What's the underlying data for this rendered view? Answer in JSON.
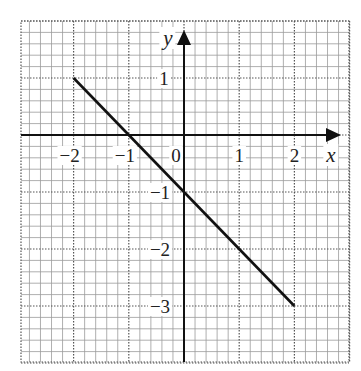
{
  "chart_data": {
    "type": "line",
    "title": "",
    "xlabel": "x",
    "ylabel": "y",
    "xlim": [
      -3,
      3
    ],
    "ylim": [
      -4,
      2
    ],
    "grid": true,
    "minor_divisions_per_unit": 5,
    "x_ticks": [
      {
        "value": -2,
        "label": "−2"
      },
      {
        "value": -1,
        "label": "−1"
      },
      {
        "value": 1,
        "label": "1"
      },
      {
        "value": 2,
        "label": "2"
      }
    ],
    "y_ticks": [
      {
        "value": 1,
        "label": "1"
      },
      {
        "value": -1,
        "label": "−1"
      },
      {
        "value": -2,
        "label": "−2"
      },
      {
        "value": -3,
        "label": "−3"
      }
    ],
    "origin_label": "0",
    "series": [
      {
        "name": "y = -x - 1",
        "x": [
          -2,
          2
        ],
        "y": [
          1,
          -3
        ],
        "color": "#111111"
      }
    ]
  },
  "colors": {
    "minor_grid": "#9a9a9a",
    "major_grid": "#555555",
    "axis": "#111111",
    "line": "#111111"
  }
}
